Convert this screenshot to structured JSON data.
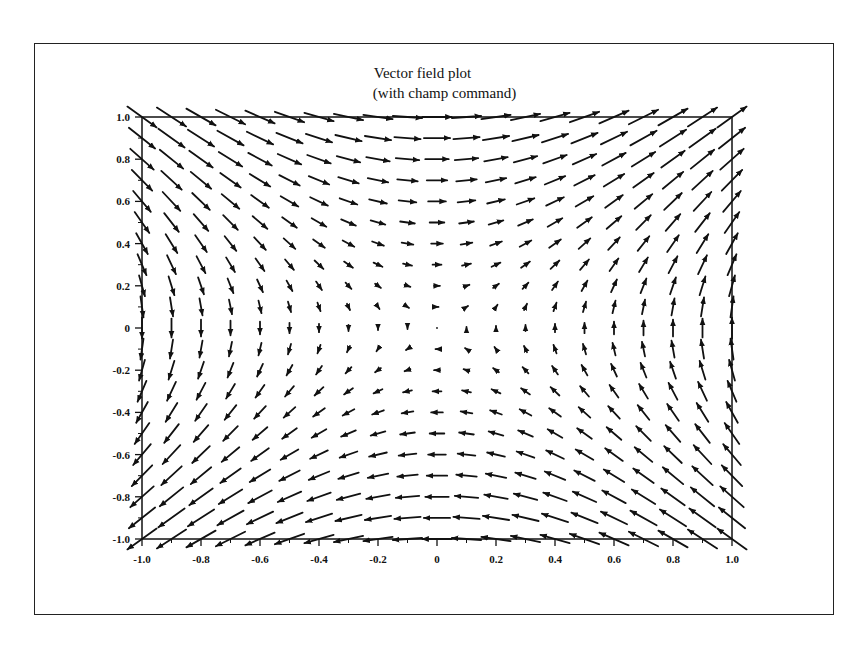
{
  "chart_data": {
    "type": "quiver",
    "title": "Vector field plot",
    "subtitle": "(with champ command)",
    "xlabel": "",
    "ylabel": "",
    "xlim": [
      -1.0,
      1.0
    ],
    "ylim": [
      -1.0,
      1.0
    ],
    "grid": false,
    "legend": null,
    "x_ticks": [
      "-1.0",
      "-0.8",
      "-0.6",
      "-0.4",
      "-0.2",
      "0",
      "0.2",
      "0.4",
      "0.6",
      "0.8",
      "1.0"
    ],
    "y_ticks": [
      "1.0",
      "0.8",
      "0.6",
      "0.4",
      "0.2",
      "0",
      "-0.2",
      "-0.4",
      "-0.6",
      "-0.8",
      "-1.0"
    ],
    "field": {
      "description": "Saddle-type vector field, approximately (u, v) = (y, x)",
      "x_grid": [
        -1.0,
        -0.9,
        -0.8,
        -0.7,
        -0.6,
        -0.5,
        -0.4,
        -0.3,
        -0.2,
        -0.1,
        0.0,
        0.1,
        0.2,
        0.3,
        0.4,
        0.5,
        0.6,
        0.7,
        0.8,
        0.9,
        1.0
      ],
      "y_grid": [
        -1.0,
        -0.9,
        -0.8,
        -0.7,
        -0.6,
        -0.5,
        -0.4,
        -0.3,
        -0.2,
        -0.1,
        0.0,
        0.1,
        0.2,
        0.3,
        0.4,
        0.5,
        0.6,
        0.7,
        0.8,
        0.9,
        1.0
      ],
      "u": "y",
      "v": "x",
      "max_arrow_length": 0.14
    }
  },
  "colors": {
    "background": "#ffffff",
    "ink": "#111111"
  }
}
